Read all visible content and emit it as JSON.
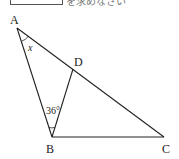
{
  "header": {
    "top_text": "を求めなさい"
  },
  "diagram": {
    "type": "triangle-geometry",
    "vertices": [
      {
        "id": "A",
        "label": "A",
        "x": 17,
        "y": 28,
        "lx": 10,
        "ly": 24
      },
      {
        "id": "B",
        "label": "B",
        "x": 52,
        "y": 137,
        "lx": 46,
        "ly": 153
      },
      {
        "id": "C",
        "label": "C",
        "x": 164,
        "y": 137,
        "lx": 162,
        "ly": 153
      },
      {
        "id": "D",
        "label": "D",
        "x": 73,
        "y": 69,
        "lx": 74,
        "ly": 66
      }
    ],
    "segments": [
      "AB",
      "AC",
      "BC",
      "BD"
    ],
    "angles": [
      {
        "at": "A",
        "label": "x",
        "between": [
          "AB",
          "AD"
        ]
      },
      {
        "at": "B",
        "label": "36°",
        "between": [
          "BA",
          "BD"
        ]
      }
    ],
    "stroke_color": "#222222"
  }
}
